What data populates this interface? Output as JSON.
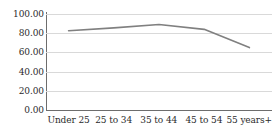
{
  "chart_data": {
    "type": "line",
    "title": "",
    "subtitle": "",
    "xlabel": "",
    "ylabel": "",
    "categories": [
      "Under 25",
      "25 to 34",
      "35 to 44",
      "45 to 54",
      "55 years+"
    ],
    "values": [
      82.5,
      85.5,
      89.0,
      84.0,
      65.0
    ],
    "series": [
      {
        "name": "",
        "values": [
          82.5,
          85.5,
          89.0,
          84.0,
          65.0
        ]
      }
    ],
    "ylim": [
      0,
      100
    ],
    "y_ticks": [
      0,
      20,
      40,
      60,
      80,
      100
    ],
    "y_tick_labels": [
      "0.00",
      "20.00",
      "40.00",
      "60.00",
      "80.00",
      "100.00"
    ],
    "grid": true,
    "grid_axis": "y",
    "legend": false,
    "legend_position": "none",
    "markers": false,
    "line_color": "#808080",
    "grid_color": "#d9d9d9",
    "axis_color": "#6d6d6d",
    "text_color": "#2b2b2b",
    "background_color": "#ffffff"
  }
}
